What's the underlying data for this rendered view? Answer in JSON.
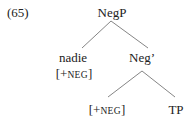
{
  "example_number": "(65)",
  "tree": {
    "root": {
      "label": "NegP"
    },
    "spec": {
      "label": "nadie",
      "feature_open": "[+",
      "feature_sc": "neg",
      "feature_close": "]"
    },
    "bar": {
      "label": "Neg’"
    },
    "head": {
      "feature_open": "[+",
      "feature_sc": "neg",
      "feature_close": "]"
    },
    "complement": {
      "label": "TP"
    }
  },
  "colors": {
    "line": "#777777",
    "text": "#222222"
  }
}
